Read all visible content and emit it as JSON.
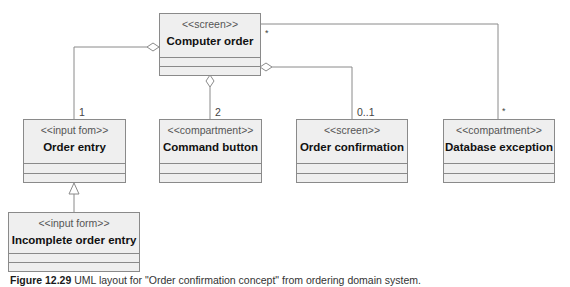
{
  "classes": {
    "computer_order": {
      "stereotype": "<<screen>>",
      "name": "Computer order"
    },
    "order_entry": {
      "stereotype": "<<input fom>>",
      "name": "Order entry"
    },
    "command_button": {
      "stereotype": "<<compartment>>",
      "name": "Command button"
    },
    "order_confirmation": {
      "stereotype": "<<screen>>",
      "name": "Order confirmation"
    },
    "database_exception": {
      "stereotype": "<<compartment>>",
      "name": "Database exception"
    },
    "incomplete_order_entry": {
      "stereotype": "<<input form>>",
      "name": "Incomplete order entry"
    }
  },
  "multiplicities": {
    "order_entry": "1",
    "command_button": "2",
    "order_confirmation": "0..1",
    "database_exception_end": "*",
    "computer_order_end": "*"
  },
  "relationships": [
    {
      "from": "computer_order",
      "to": "order_entry",
      "type": "aggregation"
    },
    {
      "from": "computer_order",
      "to": "command_button",
      "type": "aggregation"
    },
    {
      "from": "computer_order",
      "to": "order_confirmation",
      "type": "aggregation"
    },
    {
      "from": "computer_order",
      "to": "database_exception",
      "type": "association"
    },
    {
      "from": "incomplete_order_entry",
      "to": "order_entry",
      "type": "generalization"
    }
  ],
  "caption": {
    "label": "Figure 12.29",
    "text": "UML layout for \"Order confirmation concept\" from ordering domain system."
  }
}
